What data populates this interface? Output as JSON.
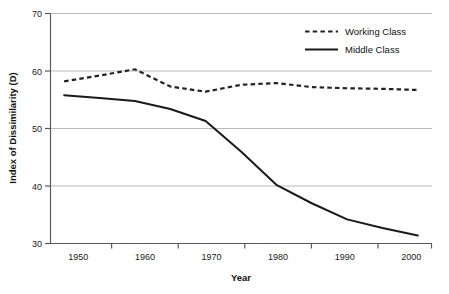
{
  "chart_data": {
    "type": "line",
    "title": "",
    "xlabel": "Year",
    "ylabel": "Index of Dissimilarity (D)",
    "xlim": [
      1948,
      2002
    ],
    "ylim": [
      30,
      70
    ],
    "yticks": [
      30,
      40,
      50,
      60,
      70
    ],
    "xticks": [
      1950,
      1960,
      1970,
      1980,
      1990,
      2000
    ],
    "ytick_labels": [
      "30",
      "40",
      "50",
      "60",
      "70"
    ],
    "xtick_labels": [
      "1950",
      "1960",
      "1970",
      "1980",
      "1990",
      "2000"
    ],
    "grid": "horizontal",
    "legend_position": "top-right",
    "x": [
      1950,
      1955,
      1960,
      1965,
      1970,
      1975,
      1980,
      1985,
      1990,
      1995,
      2000
    ],
    "series": [
      {
        "name": "Working Class",
        "style": "dashed",
        "color": "#222222",
        "values": [
          58.2,
          59.2,
          60.3,
          57.3,
          56.4,
          57.6,
          57.9,
          57.2,
          57.0,
          56.9,
          56.7
        ]
      },
      {
        "name": "Middle Class",
        "style": "solid",
        "color": "#1a1a1a",
        "values": [
          55.8,
          55.3,
          54.8,
          53.4,
          51.3,
          46.0,
          40.2,
          37.0,
          34.2,
          32.7,
          31.4
        ]
      }
    ]
  },
  "axes": {
    "ylabel": "Index of Dissimilarity (D)",
    "xlabel": "Year"
  },
  "legend": {
    "items": [
      {
        "label": "Working Class",
        "swatch": "dashed-line-swatch"
      },
      {
        "label": "Middle Class",
        "swatch": "solid-line-swatch"
      }
    ]
  }
}
